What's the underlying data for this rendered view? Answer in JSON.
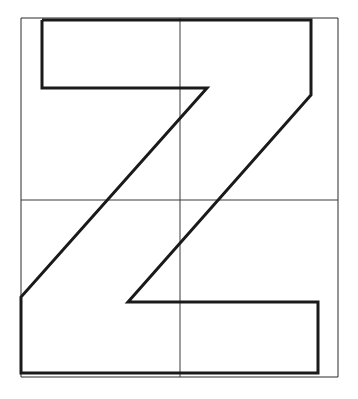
{
  "document": {
    "title": "Letter Z Geometric Construction Drawing",
    "kind": "line-drawing",
    "background_color": "#ffffff",
    "width": 358,
    "height": 399
  },
  "palette": {
    "ink": "#1a1a1a",
    "guide_ink": "#3a3a3a",
    "paper": "#ffffff"
  },
  "frame": {
    "name": "outer-bounding-rectangle",
    "stroke_color": "#2b2b2b",
    "stroke_width": 1,
    "x": 21,
    "y": 18,
    "width": 317,
    "height": 359,
    "points": "21,18 338,18 338,377 21,377 21,18"
  },
  "guides": {
    "stroke_color": "#3a3a3a",
    "stroke_width": 1,
    "horizontal_midline": {
      "name": "horizontal-center-guide",
      "label": "horizontal midline",
      "y": 200,
      "x1": 21,
      "x2": 338,
      "points": "21,200 338,200"
    },
    "vertical_midline": {
      "name": "vertical-center-guide",
      "label": "vertical midline",
      "x": 180,
      "y1": 18,
      "y2": 377,
      "points": "180,18 180,377"
    }
  },
  "glyph": {
    "name": "letter-z-outline",
    "character": "Z",
    "description": "Thick closed outline of a stylized capital letter Z with angled diagonal stem",
    "stroke_color": "#1a1a1a",
    "stroke_width": 3,
    "fill": "none",
    "closed": true,
    "vertex_count": 10,
    "points": "42,20 311,20 311,95 128,302 318,302 318,373 21,373 21,297 207,88 42,88 42,20",
    "vertices": [
      {
        "id": "v1",
        "name": "top-bar-left-top",
        "x": 42,
        "y": 20
      },
      {
        "id": "v2",
        "name": "top-bar-right-top",
        "x": 311,
        "y": 20
      },
      {
        "id": "v3",
        "name": "upper-diagonal-start",
        "x": 311,
        "y": 95
      },
      {
        "id": "v4",
        "name": "bottom-bar-left-top",
        "x": 128,
        "y": 302
      },
      {
        "id": "v5",
        "name": "bottom-bar-right-top",
        "x": 318,
        "y": 302
      },
      {
        "id": "v6",
        "name": "bottom-bar-right-bottom",
        "x": 318,
        "y": 373
      },
      {
        "id": "v7",
        "name": "bottom-bar-left-bottom",
        "x": 21,
        "y": 373
      },
      {
        "id": "v8",
        "name": "lower-diagonal-start",
        "x": 21,
        "y": 297
      },
      {
        "id": "v9",
        "name": "inner-notch-right",
        "x": 207,
        "y": 88
      },
      {
        "id": "v10",
        "name": "top-bar-left-bottom",
        "x": 42,
        "y": 88
      }
    ],
    "segments": [
      {
        "name": "top-bar-upper-edge",
        "from": "v1",
        "to": "v2",
        "orientation": "horizontal"
      },
      {
        "name": "top-right-stem",
        "from": "v2",
        "to": "v3",
        "orientation": "vertical"
      },
      {
        "name": "outer-diagonal",
        "from": "v3",
        "to": "v4",
        "orientation": "diagonal"
      },
      {
        "name": "bottom-bar-upper-edge",
        "from": "v4",
        "to": "v5",
        "orientation": "horizontal"
      },
      {
        "name": "bottom-right-stem",
        "from": "v5",
        "to": "v6",
        "orientation": "vertical"
      },
      {
        "name": "bottom-bar-lower-edge",
        "from": "v6",
        "to": "v7",
        "orientation": "horizontal"
      },
      {
        "name": "bottom-left-stem",
        "from": "v7",
        "to": "v8",
        "orientation": "vertical"
      },
      {
        "name": "inner-diagonal",
        "from": "v8",
        "to": "v9",
        "orientation": "diagonal"
      },
      {
        "name": "top-bar-lower-edge",
        "from": "v9",
        "to": "v10",
        "orientation": "horizontal"
      },
      {
        "name": "top-left-stem",
        "from": "v10",
        "to": "v1",
        "orientation": "vertical"
      }
    ]
  }
}
